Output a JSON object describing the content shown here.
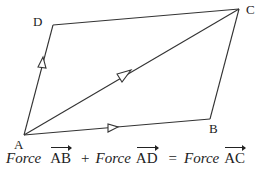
{
  "diagram": {
    "type": "parallelogram-of-forces",
    "vertices": {
      "A": {
        "label": "A",
        "x": 24,
        "y": 135
      },
      "B": {
        "label": "B",
        "x": 210,
        "y": 119
      },
      "C": {
        "label": "C",
        "x": 239,
        "y": 9
      },
      "D": {
        "label": "D",
        "x": 53,
        "y": 25
      }
    },
    "edges": [
      {
        "from": "A",
        "to": "B",
        "arrow": true
      },
      {
        "from": "B",
        "to": "C",
        "arrow": false
      },
      {
        "from": "C",
        "to": "D",
        "arrow": false
      },
      {
        "from": "D",
        "to": "A",
        "arrow": true,
        "arrow_direction": "A-to-D"
      },
      {
        "from": "A",
        "to": "C",
        "arrow": true,
        "diagonal": true
      }
    ],
    "line_color": "#333333"
  },
  "equation": {
    "term1_word": "Force",
    "term1_vector": "AB",
    "plus": "+",
    "term2_word": "Force",
    "term2_vector": "AD",
    "equals": "=",
    "term3_word": "Force",
    "term3_vector": "AC"
  }
}
